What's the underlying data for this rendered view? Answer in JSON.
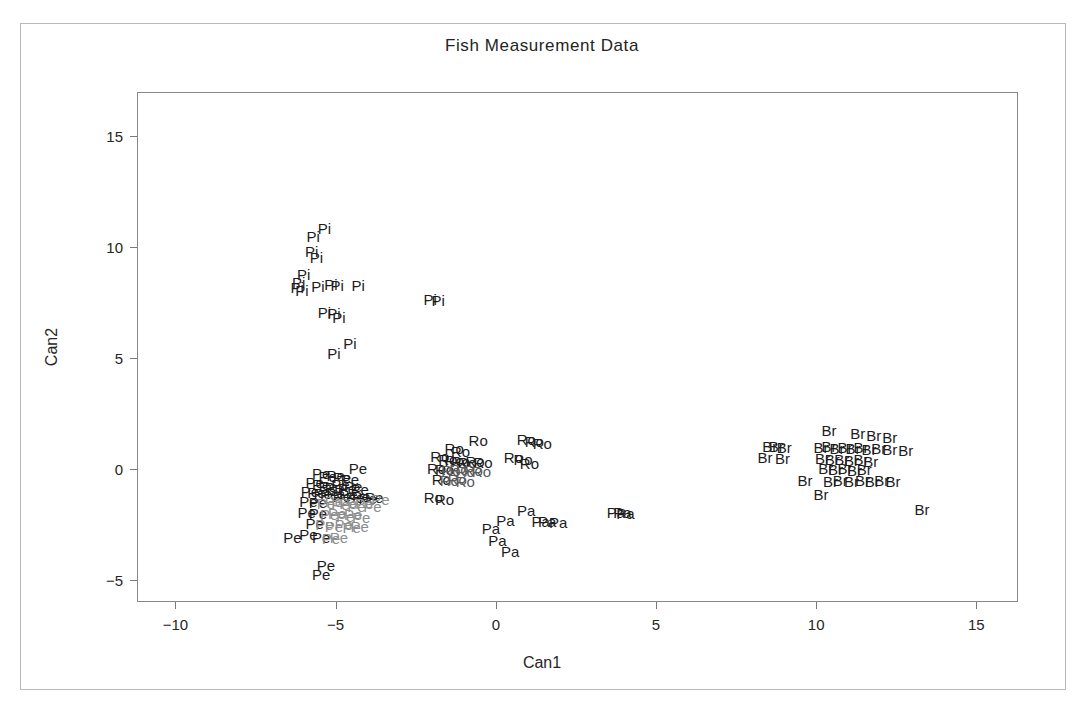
{
  "chart_data": {
    "type": "scatter",
    "title": "Fish Measurement Data",
    "xlabel": "Can1",
    "ylabel": "Can2",
    "xlim": [
      -11.2,
      16.3
    ],
    "ylim": [
      -6.0,
      17.0
    ],
    "xticks": [
      -10,
      -5,
      0,
      5,
      10,
      15
    ],
    "xticklabels": [
      "-10",
      "-5",
      "0",
      "5",
      "10",
      "15"
    ],
    "yticks": [
      -5,
      0,
      5,
      10,
      15
    ],
    "yticklabels": [
      "-5",
      "0",
      "5",
      "10",
      "15"
    ],
    "grid": false,
    "legend": false,
    "marker_style": "text-label",
    "groups": [
      {
        "name": "Pike",
        "code": "Pi",
        "color": "#1c1c1c"
      },
      {
        "name": "Perch",
        "code": "Pe",
        "color": "#1c1c1c"
      },
      {
        "name": "Roach",
        "code": "Ro",
        "color": "#1c1c1c"
      },
      {
        "name": "Parkki",
        "code": "Pa",
        "color": "#1c1c1c"
      },
      {
        "name": "Bream",
        "code": "Br",
        "color": "#1c1c1c"
      }
    ],
    "points": [
      {
        "label": "Pi",
        "x": -5.35,
        "y": 10.85
      },
      {
        "label": "Pi",
        "x": -5.7,
        "y": 10.5
      },
      {
        "label": "Pi",
        "x": -5.75,
        "y": 9.85
      },
      {
        "label": "Pi",
        "x": -5.6,
        "y": 9.55
      },
      {
        "label": "Pi",
        "x": -6.0,
        "y": 8.8
      },
      {
        "label": "Pi",
        "x": -6.15,
        "y": 8.45
      },
      {
        "label": "Pi",
        "x": -6.2,
        "y": 8.2
      },
      {
        "label": "Pi",
        "x": -6.05,
        "y": 8.05
      },
      {
        "label": "Pi",
        "x": -5.55,
        "y": 8.25
      },
      {
        "label": "Pi",
        "x": -5.15,
        "y": 8.35
      },
      {
        "label": "Pi",
        "x": -4.95,
        "y": 8.3
      },
      {
        "label": "Pi",
        "x": -4.3,
        "y": 8.3
      },
      {
        "label": "Pi",
        "x": -2.05,
        "y": 7.65
      },
      {
        "label": "Pi",
        "x": -1.8,
        "y": 7.6
      },
      {
        "label": "Pi",
        "x": -5.35,
        "y": 7.1
      },
      {
        "label": "Pi",
        "x": -5.05,
        "y": 7.05
      },
      {
        "label": "Pi",
        "x": -4.9,
        "y": 6.85
      },
      {
        "label": "Pi",
        "x": -4.55,
        "y": 5.7
      },
      {
        "label": "Pi",
        "x": -5.05,
        "y": 5.25
      },
      {
        "label": "Pe",
        "x": -4.3,
        "y": 0.05
      },
      {
        "label": "Pe",
        "x": -5.45,
        "y": -0.2
      },
      {
        "label": "Pe",
        "x": -5.25,
        "y": -0.3
      },
      {
        "label": "Pe",
        "x": -5.0,
        "y": -0.25
      },
      {
        "label": "Pe",
        "x": -4.8,
        "y": -0.35
      },
      {
        "label": "Pe",
        "x": -4.55,
        "y": -0.45
      },
      {
        "label": "Pe",
        "x": -5.65,
        "y": -0.6
      },
      {
        "label": "Pe",
        "x": -5.45,
        "y": -0.7
      },
      {
        "label": "Pe",
        "x": -5.25,
        "y": -0.75
      },
      {
        "label": "Pe",
        "x": -5.05,
        "y": -0.8
      },
      {
        "label": "Pe",
        "x": -4.85,
        "y": -0.7
      },
      {
        "label": "Pe",
        "x": -4.65,
        "y": -0.85
      },
      {
        "label": "Pe",
        "x": -4.45,
        "y": -0.75
      },
      {
        "label": "Pe",
        "x": -4.25,
        "y": -0.9
      },
      {
        "label": "Pe",
        "x": -5.8,
        "y": -1.0
      },
      {
        "label": "Pe",
        "x": -5.6,
        "y": -1.05
      },
      {
        "label": "Pe",
        "x": -5.4,
        "y": -1.1
      },
      {
        "label": "Pe",
        "x": -5.2,
        "y": -1.15
      },
      {
        "label": "Pe",
        "x": -5.0,
        "y": -1.1
      },
      {
        "label": "Pe",
        "x": -4.8,
        "y": -1.2
      },
      {
        "label": "Pe",
        "x": -4.6,
        "y": -1.15
      },
      {
        "label": "Pe",
        "x": -4.4,
        "y": -1.25
      },
      {
        "label": "Pe",
        "x": -4.2,
        "y": -1.2
      },
      {
        "label": "Pe",
        "x": -4.0,
        "y": -1.3
      },
      {
        "label": "Pe",
        "x": -3.8,
        "y": -1.25
      },
      {
        "label": "Pe",
        "x": -3.6,
        "y": -1.35
      },
      {
        "label": "Pe",
        "x": -5.85,
        "y": -1.45
      },
      {
        "label": "Pe",
        "x": -5.55,
        "y": -1.5
      },
      {
        "label": "Pe",
        "x": -5.3,
        "y": -1.55
      },
      {
        "label": "Pe",
        "x": -5.05,
        "y": -1.45
      },
      {
        "label": "Pe",
        "x": -4.85,
        "y": -1.6
      },
      {
        "label": "Pe",
        "x": -4.6,
        "y": -1.55
      },
      {
        "label": "Pe",
        "x": -4.35,
        "y": -1.65
      },
      {
        "label": "Pe",
        "x": -4.1,
        "y": -1.55
      },
      {
        "label": "Pe",
        "x": -3.85,
        "y": -1.65
      },
      {
        "label": "Pe",
        "x": -5.9,
        "y": -1.95
      },
      {
        "label": "Pe",
        "x": -5.55,
        "y": -2.0
      },
      {
        "label": "Pe",
        "x": -5.2,
        "y": -2.05
      },
      {
        "label": "Pe",
        "x": -4.95,
        "y": -2.0
      },
      {
        "label": "Pe",
        "x": -4.7,
        "y": -2.1
      },
      {
        "label": "Pe",
        "x": -4.45,
        "y": -2.05
      },
      {
        "label": "Pe",
        "x": -4.2,
        "y": -2.15
      },
      {
        "label": "Pe",
        "x": -5.65,
        "y": -2.45
      },
      {
        "label": "Pe",
        "x": -5.35,
        "y": -2.5
      },
      {
        "label": "Pe",
        "x": -5.05,
        "y": -2.55
      },
      {
        "label": "Pe",
        "x": -4.75,
        "y": -2.5
      },
      {
        "label": "Pe",
        "x": -4.5,
        "y": -2.6
      },
      {
        "label": "Pe",
        "x": -4.25,
        "y": -2.55
      },
      {
        "label": "Pe",
        "x": -6.35,
        "y": -3.05
      },
      {
        "label": "Pe",
        "x": -5.85,
        "y": -2.95
      },
      {
        "label": "Pe",
        "x": -5.45,
        "y": -3.05
      },
      {
        "label": "Pe",
        "x": -5.15,
        "y": -3.1
      },
      {
        "label": "Pe",
        "x": -4.9,
        "y": -3.05
      },
      {
        "label": "Pe",
        "x": -5.3,
        "y": -4.35
      },
      {
        "label": "Pe",
        "x": -5.45,
        "y": -4.75
      },
      {
        "label": "Ro",
        "x": -0.55,
        "y": 1.3
      },
      {
        "label": "Ro",
        "x": 0.95,
        "y": 1.35
      },
      {
        "label": "Ro",
        "x": 1.2,
        "y": 1.25
      },
      {
        "label": "Ro",
        "x": 1.45,
        "y": 1.15
      },
      {
        "label": "Ro",
        "x": -1.3,
        "y": 0.95
      },
      {
        "label": "Ro",
        "x": -1.1,
        "y": 0.8
      },
      {
        "label": "Ro",
        "x": -1.75,
        "y": 0.6
      },
      {
        "label": "Ro",
        "x": -1.5,
        "y": 0.45
      },
      {
        "label": "Ro",
        "x": -1.3,
        "y": 0.4
      },
      {
        "label": "Ro",
        "x": -1.1,
        "y": 0.35
      },
      {
        "label": "Ro",
        "x": -0.9,
        "y": 0.3
      },
      {
        "label": "Ro",
        "x": -0.65,
        "y": 0.35
      },
      {
        "label": "Ro",
        "x": -0.4,
        "y": 0.3
      },
      {
        "label": "Ro",
        "x": 0.55,
        "y": 0.55
      },
      {
        "label": "Ro",
        "x": 0.85,
        "y": 0.45
      },
      {
        "label": "Ro",
        "x": 1.05,
        "y": 0.25
      },
      {
        "label": "Ro",
        "x": -1.85,
        "y": 0.05
      },
      {
        "label": "Ro",
        "x": -1.6,
        "y": 0.0
      },
      {
        "label": "Ro",
        "x": -1.4,
        "y": -0.05
      },
      {
        "label": "Ro",
        "x": -1.15,
        "y": 0.0
      },
      {
        "label": "Ro",
        "x": -0.95,
        "y": -0.1
      },
      {
        "label": "Ro",
        "x": -0.7,
        "y": -0.05
      },
      {
        "label": "Ro",
        "x": -0.45,
        "y": -0.1
      },
      {
        "label": "Ro",
        "x": -1.7,
        "y": -0.45
      },
      {
        "label": "Ro",
        "x": -1.45,
        "y": -0.5
      },
      {
        "label": "Ro",
        "x": -1.2,
        "y": -0.45
      },
      {
        "label": "Ro",
        "x": -0.95,
        "y": -0.55
      },
      {
        "label": "Ro",
        "x": -1.95,
        "y": -1.25
      },
      {
        "label": "Ro",
        "x": -1.6,
        "y": -1.35
      },
      {
        "label": "Pa",
        "x": 0.95,
        "y": -1.85
      },
      {
        "label": "Pa",
        "x": 3.75,
        "y": -1.95
      },
      {
        "label": "Pa",
        "x": 3.95,
        "y": -1.95
      },
      {
        "label": "Pa",
        "x": 4.05,
        "y": -2.0
      },
      {
        "label": "Pa",
        "x": 0.3,
        "y": -2.3
      },
      {
        "label": "Pa",
        "x": 1.4,
        "y": -2.35
      },
      {
        "label": "Pa",
        "x": 1.6,
        "y": -2.35
      },
      {
        "label": "Pa",
        "x": 1.95,
        "y": -2.4
      },
      {
        "label": "Pa",
        "x": -0.15,
        "y": -2.65
      },
      {
        "label": "Pa",
        "x": 0.05,
        "y": -3.2
      },
      {
        "label": "Pa",
        "x": 0.45,
        "y": -3.7
      },
      {
        "label": "Br",
        "x": 10.4,
        "y": 1.75
      },
      {
        "label": "Br",
        "x": 11.3,
        "y": 1.6
      },
      {
        "label": "Br",
        "x": 11.8,
        "y": 1.55
      },
      {
        "label": "Br",
        "x": 12.3,
        "y": 1.45
      },
      {
        "label": "Br",
        "x": 8.55,
        "y": 1.05
      },
      {
        "label": "Br",
        "x": 8.75,
        "y": 1.05
      },
      {
        "label": "Br",
        "x": 9.0,
        "y": 1.0
      },
      {
        "label": "Br",
        "x": 10.15,
        "y": 1.0
      },
      {
        "label": "Br",
        "x": 10.4,
        "y": 1.05
      },
      {
        "label": "Br",
        "x": 10.65,
        "y": 0.95
      },
      {
        "label": "Br",
        "x": 10.9,
        "y": 1.0
      },
      {
        "label": "Br",
        "x": 11.15,
        "y": 0.95
      },
      {
        "label": "Br",
        "x": 11.4,
        "y": 1.0
      },
      {
        "label": "Br",
        "x": 11.65,
        "y": 0.9
      },
      {
        "label": "Br",
        "x": 11.95,
        "y": 0.95
      },
      {
        "label": "Br",
        "x": 12.3,
        "y": 0.9
      },
      {
        "label": "Br",
        "x": 12.8,
        "y": 0.85
      },
      {
        "label": "Br",
        "x": 8.4,
        "y": 0.55
      },
      {
        "label": "Br",
        "x": 8.95,
        "y": 0.5
      },
      {
        "label": "Br",
        "x": 10.2,
        "y": 0.5
      },
      {
        "label": "Br",
        "x": 10.5,
        "y": 0.45
      },
      {
        "label": "Br",
        "x": 10.8,
        "y": 0.45
      },
      {
        "label": "Br",
        "x": 11.1,
        "y": 0.4
      },
      {
        "label": "Br",
        "x": 11.4,
        "y": 0.45
      },
      {
        "label": "Br",
        "x": 11.7,
        "y": 0.35
      },
      {
        "label": "Br",
        "x": 10.3,
        "y": 0.05
      },
      {
        "label": "Br",
        "x": 10.6,
        "y": 0.0
      },
      {
        "label": "Br",
        "x": 10.9,
        "y": 0.05
      },
      {
        "label": "Br",
        "x": 11.2,
        "y": -0.05
      },
      {
        "label": "Br",
        "x": 11.5,
        "y": 0.0
      },
      {
        "label": "Br",
        "x": 9.65,
        "y": -0.5
      },
      {
        "label": "Br",
        "x": 10.45,
        "y": -0.55
      },
      {
        "label": "Br",
        "x": 10.75,
        "y": -0.5
      },
      {
        "label": "Br",
        "x": 11.1,
        "y": -0.55
      },
      {
        "label": "Br",
        "x": 11.45,
        "y": -0.5
      },
      {
        "label": "Br",
        "x": 11.75,
        "y": -0.55
      },
      {
        "label": "Br",
        "x": 12.05,
        "y": -0.5
      },
      {
        "label": "Br",
        "x": 12.4,
        "y": -0.55
      },
      {
        "label": "Br",
        "x": 10.15,
        "y": -1.15
      },
      {
        "label": "Br",
        "x": 13.3,
        "y": -1.8
      }
    ]
  }
}
